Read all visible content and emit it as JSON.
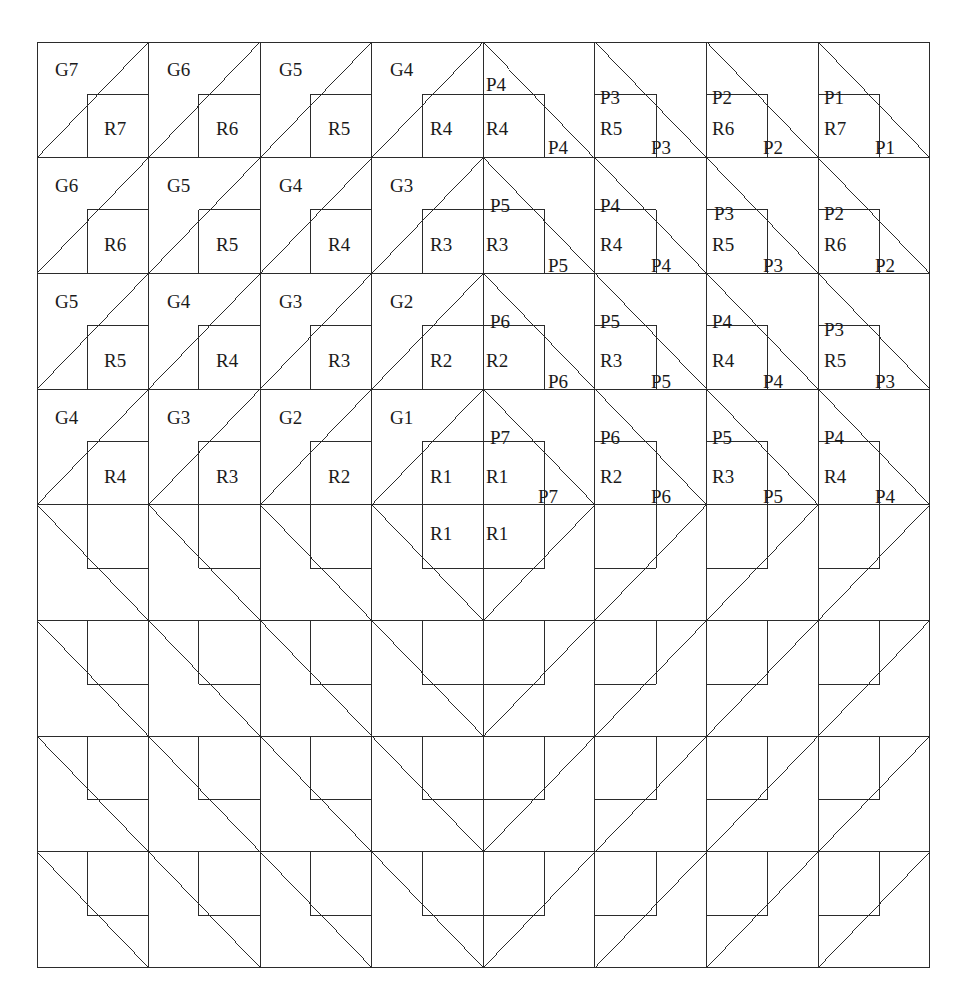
{
  "figure": {
    "kind": "tiling-diagram",
    "grid": {
      "columns": 8,
      "rows": 8,
      "origin_x": 37,
      "origin_y": 42,
      "cell_width": 111.6,
      "cell_height": 115.7,
      "line_color": "#2b2b2b",
      "line_width": 1,
      "background": "#ffffff"
    },
    "cell_types": {
      "rising": "diagonal from bottom-left to top-right, inner square in bottom-right",
      "falling": "diagonal from top-left to bottom-right, inner square in bottom-left"
    },
    "inner_square_fraction": 0.55
  },
  "labels": [
    {
      "text": "G7",
      "x": 55,
      "y": 60,
      "role": "g-label",
      "row": 1,
      "col": 1
    },
    {
      "text": "R7",
      "x": 104,
      "y": 119,
      "role": "r-label",
      "row": 1,
      "col": 1
    },
    {
      "text": "G6",
      "x": 167,
      "y": 60,
      "role": "g-label",
      "row": 1,
      "col": 2
    },
    {
      "text": "R6",
      "x": 216,
      "y": 119,
      "role": "r-label",
      "row": 1,
      "col": 2
    },
    {
      "text": "G5",
      "x": 279,
      "y": 60,
      "role": "g-label",
      "row": 1,
      "col": 3
    },
    {
      "text": "R5",
      "x": 328,
      "y": 119,
      "role": "r-label",
      "row": 1,
      "col": 3
    },
    {
      "text": "G4",
      "x": 390,
      "y": 60,
      "role": "g-label",
      "row": 1,
      "col": 4
    },
    {
      "text": "R4",
      "x": 430,
      "y": 119,
      "role": "r-label",
      "row": 1,
      "col": 4
    },
    {
      "text": "P4",
      "x": 486,
      "y": 75,
      "role": "p-label",
      "row": 1,
      "col": 5
    },
    {
      "text": "R4",
      "x": 486,
      "y": 119,
      "role": "r-label",
      "row": 1,
      "col": 5
    },
    {
      "text": "P4",
      "x": 548,
      "y": 138,
      "role": "p-label",
      "row": 1,
      "col": 5
    },
    {
      "text": "P3",
      "x": 600,
      "y": 88,
      "role": "p-label",
      "row": 1,
      "col": 6
    },
    {
      "text": "R5",
      "x": 600,
      "y": 119,
      "role": "r-label",
      "row": 1,
      "col": 6
    },
    {
      "text": "P3",
      "x": 651,
      "y": 138,
      "role": "p-label",
      "row": 1,
      "col": 6
    },
    {
      "text": "P2",
      "x": 712,
      "y": 88,
      "role": "p-label",
      "row": 1,
      "col": 7
    },
    {
      "text": "R6",
      "x": 712,
      "y": 119,
      "role": "r-label",
      "row": 1,
      "col": 7
    },
    {
      "text": "P2",
      "x": 763,
      "y": 138,
      "role": "p-label",
      "row": 1,
      "col": 7
    },
    {
      "text": "P1",
      "x": 824,
      "y": 88,
      "role": "p-label",
      "row": 1,
      "col": 8
    },
    {
      "text": "R7",
      "x": 824,
      "y": 119,
      "role": "r-label",
      "row": 1,
      "col": 8
    },
    {
      "text": "P1",
      "x": 875,
      "y": 138,
      "role": "p-label",
      "row": 1,
      "col": 8
    },
    {
      "text": "G6",
      "x": 55,
      "y": 176,
      "role": "g-label",
      "row": 2,
      "col": 1
    },
    {
      "text": "R6",
      "x": 104,
      "y": 235,
      "role": "r-label",
      "row": 2,
      "col": 1
    },
    {
      "text": "G5",
      "x": 167,
      "y": 176,
      "role": "g-label",
      "row": 2,
      "col": 2
    },
    {
      "text": "R5",
      "x": 216,
      "y": 235,
      "role": "r-label",
      "row": 2,
      "col": 2
    },
    {
      "text": "G4",
      "x": 279,
      "y": 176,
      "role": "g-label",
      "row": 2,
      "col": 3
    },
    {
      "text": "R4",
      "x": 328,
      "y": 235,
      "role": "r-label",
      "row": 2,
      "col": 3
    },
    {
      "text": "G3",
      "x": 390,
      "y": 176,
      "role": "g-label",
      "row": 2,
      "col": 4
    },
    {
      "text": "R3",
      "x": 430,
      "y": 235,
      "role": "r-label",
      "row": 2,
      "col": 4
    },
    {
      "text": "P5",
      "x": 490,
      "y": 196,
      "role": "p-label",
      "row": 2,
      "col": 5
    },
    {
      "text": "R3",
      "x": 486,
      "y": 235,
      "role": "r-label",
      "row": 2,
      "col": 5
    },
    {
      "text": "P5",
      "x": 548,
      "y": 256,
      "role": "p-label",
      "row": 2,
      "col": 5
    },
    {
      "text": "P4",
      "x": 600,
      "y": 196,
      "role": "p-label",
      "row": 2,
      "col": 6
    },
    {
      "text": "R4",
      "x": 600,
      "y": 235,
      "role": "r-label",
      "row": 2,
      "col": 6
    },
    {
      "text": "P4",
      "x": 651,
      "y": 256,
      "role": "p-label",
      "row": 2,
      "col": 6
    },
    {
      "text": "P3",
      "x": 714,
      "y": 204,
      "role": "p-label",
      "row": 2,
      "col": 7
    },
    {
      "text": "R5",
      "x": 712,
      "y": 235,
      "role": "r-label",
      "row": 2,
      "col": 7
    },
    {
      "text": "P3",
      "x": 763,
      "y": 256,
      "role": "p-label",
      "row": 2,
      "col": 7
    },
    {
      "text": "P2",
      "x": 824,
      "y": 204,
      "role": "p-label",
      "row": 2,
      "col": 8
    },
    {
      "text": "R6",
      "x": 824,
      "y": 235,
      "role": "r-label",
      "row": 2,
      "col": 8
    },
    {
      "text": "P2",
      "x": 875,
      "y": 256,
      "role": "p-label",
      "row": 2,
      "col": 8
    },
    {
      "text": "G5",
      "x": 55,
      "y": 292,
      "role": "g-label",
      "row": 3,
      "col": 1
    },
    {
      "text": "R5",
      "x": 104,
      "y": 351,
      "role": "r-label",
      "row": 3,
      "col": 1
    },
    {
      "text": "G4",
      "x": 167,
      "y": 292,
      "role": "g-label",
      "row": 3,
      "col": 2
    },
    {
      "text": "R4",
      "x": 216,
      "y": 351,
      "role": "r-label",
      "row": 3,
      "col": 2
    },
    {
      "text": "G3",
      "x": 279,
      "y": 292,
      "role": "g-label",
      "row": 3,
      "col": 3
    },
    {
      "text": "R3",
      "x": 328,
      "y": 351,
      "role": "r-label",
      "row": 3,
      "col": 3
    },
    {
      "text": "G2",
      "x": 390,
      "y": 292,
      "role": "g-label",
      "row": 3,
      "col": 4
    },
    {
      "text": "R2",
      "x": 430,
      "y": 351,
      "role": "r-label",
      "row": 3,
      "col": 4
    },
    {
      "text": "P6",
      "x": 490,
      "y": 312,
      "role": "p-label",
      "row": 3,
      "col": 5
    },
    {
      "text": "R2",
      "x": 486,
      "y": 351,
      "role": "r-label",
      "row": 3,
      "col": 5
    },
    {
      "text": "P6",
      "x": 548,
      "y": 372,
      "role": "p-label",
      "row": 3,
      "col": 5
    },
    {
      "text": "P5",
      "x": 600,
      "y": 312,
      "role": "p-label",
      "row": 3,
      "col": 6
    },
    {
      "text": "R3",
      "x": 600,
      "y": 351,
      "role": "r-label",
      "row": 3,
      "col": 6
    },
    {
      "text": "P5",
      "x": 651,
      "y": 372,
      "role": "p-label",
      "row": 3,
      "col": 6
    },
    {
      "text": "P4",
      "x": 712,
      "y": 312,
      "role": "p-label",
      "row": 3,
      "col": 7
    },
    {
      "text": "R4",
      "x": 712,
      "y": 351,
      "role": "r-label",
      "row": 3,
      "col": 7
    },
    {
      "text": "P4",
      "x": 763,
      "y": 372,
      "role": "p-label",
      "row": 3,
      "col": 7
    },
    {
      "text": "P3",
      "x": 824,
      "y": 320,
      "role": "p-label",
      "row": 3,
      "col": 8
    },
    {
      "text": "R5",
      "x": 824,
      "y": 351,
      "role": "r-label",
      "row": 3,
      "col": 8
    },
    {
      "text": "P3",
      "x": 875,
      "y": 372,
      "role": "p-label",
      "row": 3,
      "col": 8
    },
    {
      "text": "G4",
      "x": 55,
      "y": 408,
      "role": "g-label",
      "row": 4,
      "col": 1
    },
    {
      "text": "R4",
      "x": 104,
      "y": 467,
      "role": "r-label",
      "row": 4,
      "col": 1
    },
    {
      "text": "G3",
      "x": 167,
      "y": 408,
      "role": "g-label",
      "row": 4,
      "col": 2
    },
    {
      "text": "R3",
      "x": 216,
      "y": 467,
      "role": "r-label",
      "row": 4,
      "col": 2
    },
    {
      "text": "G2",
      "x": 279,
      "y": 408,
      "role": "g-label",
      "row": 4,
      "col": 3
    },
    {
      "text": "R2",
      "x": 328,
      "y": 467,
      "role": "r-label",
      "row": 4,
      "col": 3
    },
    {
      "text": "G1",
      "x": 390,
      "y": 408,
      "role": "g-label",
      "row": 4,
      "col": 4
    },
    {
      "text": "R1",
      "x": 430,
      "y": 467,
      "role": "r-label",
      "row": 4,
      "col": 4
    },
    {
      "text": "R1",
      "x": 430,
      "y": 524,
      "role": "r-label",
      "row": 5,
      "col": 4
    },
    {
      "text": "P7",
      "x": 490,
      "y": 428,
      "role": "p-label",
      "row": 4,
      "col": 5
    },
    {
      "text": "R1",
      "x": 486,
      "y": 467,
      "role": "r-label",
      "row": 4,
      "col": 5
    },
    {
      "text": "R1",
      "x": 486,
      "y": 524,
      "role": "r-label",
      "row": 5,
      "col": 5
    },
    {
      "text": "P7",
      "x": 538,
      "y": 487,
      "role": "p-label",
      "row": 4,
      "col": 5
    },
    {
      "text": "P6",
      "x": 600,
      "y": 428,
      "role": "p-label",
      "row": 4,
      "col": 6
    },
    {
      "text": "R2",
      "x": 600,
      "y": 467,
      "role": "r-label",
      "row": 4,
      "col": 6
    },
    {
      "text": "P6",
      "x": 651,
      "y": 487,
      "role": "p-label",
      "row": 4,
      "col": 6
    },
    {
      "text": "P5",
      "x": 712,
      "y": 428,
      "role": "p-label",
      "row": 4,
      "col": 7
    },
    {
      "text": "R3",
      "x": 712,
      "y": 467,
      "role": "r-label",
      "row": 4,
      "col": 7
    },
    {
      "text": "P5",
      "x": 763,
      "y": 487,
      "role": "p-label",
      "row": 4,
      "col": 7
    },
    {
      "text": "P4",
      "x": 824,
      "y": 428,
      "role": "p-label",
      "row": 4,
      "col": 8
    },
    {
      "text": "R4",
      "x": 824,
      "y": 467,
      "role": "r-label",
      "row": 4,
      "col": 8
    },
    {
      "text": "P4",
      "x": 875,
      "y": 487,
      "role": "p-label",
      "row": 4,
      "col": 8
    }
  ]
}
